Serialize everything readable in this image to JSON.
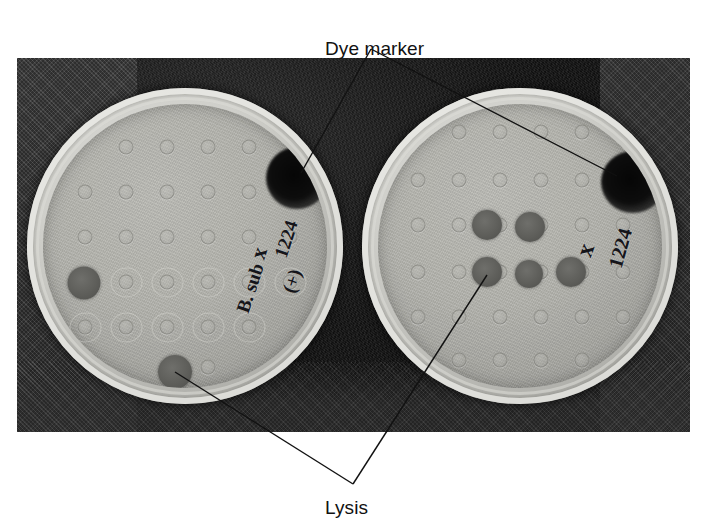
{
  "figure": {
    "type": "photograph",
    "background_color": "#ffffff"
  },
  "annotations": [
    {
      "id": "dye-marker",
      "label": "Dye marker",
      "text_x": 325,
      "text_y": 38,
      "apex_x": 371,
      "apex_y": 49,
      "targets": [
        {
          "x": 301,
          "y": 173
        },
        {
          "x": 617,
          "y": 176
        }
      ]
    },
    {
      "id": "lysis",
      "label": "Lysis",
      "text_x": 325,
      "text_y": 497,
      "apex_x": 353,
      "apex_y": 484,
      "targets": [
        {
          "x": 175,
          "y": 372
        },
        {
          "x": 487,
          "y": 275
        }
      ]
    }
  ],
  "photo": {
    "x": 17,
    "y": 58,
    "width": 673,
    "height": 374
  },
  "plates": [
    {
      "id": "left-plate",
      "cx": 185,
      "cy": 246,
      "r": 158,
      "handwriting": [
        {
          "text": "x",
          "x": 259,
          "y": 253,
          "size": 22,
          "rotate": -72
        },
        {
          "text": "1224",
          "x": 286,
          "y": 239,
          "size": 19,
          "rotate": -72
        },
        {
          "text": "B. sub",
          "x": 250,
          "y": 288,
          "size": 19,
          "rotate": -72
        },
        {
          "text": "(+)",
          "x": 292,
          "y": 281,
          "size": 19,
          "rotate": -72
        }
      ],
      "dye_marker": {
        "x": 297,
        "y": 178,
        "w": 62,
        "h": 62
      },
      "lysis_spots": [
        {
          "x": 84,
          "y": 283,
          "d": 33
        },
        {
          "x": 175,
          "y": 372,
          "d": 34
        }
      ],
      "grid": {
        "cols_x": [
          85,
          126,
          167,
          208,
          249,
          290
        ],
        "rows_y": [
          147,
          192,
          237,
          282,
          327,
          367
        ],
        "halo_rows": [
          282,
          327
        ]
      }
    },
    {
      "id": "right-plate",
      "cx": 520,
      "cy": 246,
      "r": 158,
      "handwriting": [
        {
          "text": "x",
          "x": 585,
          "y": 250,
          "size": 24,
          "rotate": -70
        },
        {
          "text": "1224",
          "x": 620,
          "y": 248,
          "size": 20,
          "rotate": -74
        }
      ],
      "dye_marker": {
        "x": 633,
        "y": 182,
        "w": 64,
        "h": 62
      },
      "lysis_spots": [
        {
          "x": 487,
          "y": 225,
          "d": 30
        },
        {
          "x": 530,
          "y": 227,
          "d": 30
        },
        {
          "x": 487,
          "y": 272,
          "d": 30
        },
        {
          "x": 529,
          "y": 274,
          "d": 28
        },
        {
          "x": 571,
          "y": 272,
          "d": 30
        }
      ],
      "grid": {
        "cols_x": [
          418,
          459,
          500,
          541,
          582,
          623
        ],
        "rows_y": [
          132,
          180,
          225,
          272,
          317,
          360
        ],
        "halo_rows": []
      }
    }
  ]
}
